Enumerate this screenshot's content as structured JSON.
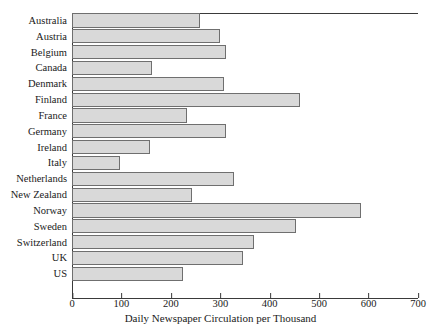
{
  "chart_data": {
    "type": "bar",
    "orientation": "horizontal",
    "title": "",
    "xlabel": "Daily Newspaper Circulation per Thousand",
    "ylabel": "",
    "xlim": [
      0,
      700
    ],
    "xticks": [
      0,
      100,
      200,
      300,
      400,
      500,
      600,
      700
    ],
    "grid": false,
    "legend": null,
    "bar_fill_color": "#d9d9d9",
    "bar_edge_color": "#6f6f6f",
    "axis_color": "#3a3a3a",
    "categories": [
      "Australia",
      "Austria",
      "Belgium",
      "Canada",
      "Denmark",
      "Finland",
      "France",
      "Germany",
      "Ireland",
      "Italy",
      "Netherlands",
      "New Zealand",
      "Norway",
      "Sweden",
      "Switzerland",
      "UK",
      "US"
    ],
    "values": [
      258,
      300,
      312,
      162,
      308,
      462,
      233,
      312,
      157,
      97,
      327,
      243,
      585,
      453,
      368,
      346,
      225
    ]
  }
}
